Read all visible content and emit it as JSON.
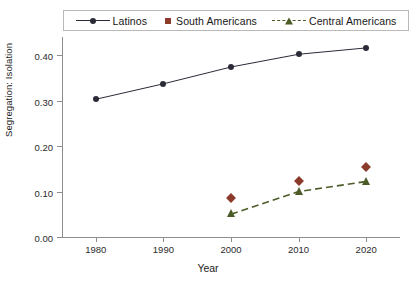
{
  "chart_data": {
    "type": "line",
    "title": "",
    "xlabel": "Year",
    "ylabel": "Segregation: Isolation",
    "x": [
      1980,
      1990,
      2000,
      2010,
      2020
    ],
    "xlim": [
      1975,
      2025
    ],
    "ylim": [
      0.0,
      0.44
    ],
    "xticks": [
      "1980",
      "1990",
      "2000",
      "2010",
      "2020"
    ],
    "yticks": [
      "0.00",
      "0.10",
      "0.20",
      "0.30",
      "0.40"
    ],
    "ytick_values": [
      0.0,
      0.1,
      0.2,
      0.3,
      0.4
    ],
    "grid": false,
    "legend_position": "top",
    "series": [
      {
        "name": "Latinos",
        "color": "#2b2b38",
        "line_style": "solid",
        "marker": "circle",
        "x": [
          1980,
          1990,
          2000,
          2010,
          2020
        ],
        "values": [
          0.303,
          0.337,
          0.374,
          0.402,
          0.416
        ]
      },
      {
        "name": "South Americans",
        "color": "#8c3a2c",
        "line_style": "none",
        "marker": "diamond",
        "x": [
          2000,
          2010,
          2020
        ],
        "values": [
          0.085,
          0.123,
          0.153
        ]
      },
      {
        "name": "Central Americans",
        "color": "#4c5c28",
        "line_style": "dashed",
        "marker": "triangle",
        "x": [
          2000,
          2010,
          2020
        ],
        "values": [
          0.05,
          0.1,
          0.122
        ]
      }
    ]
  },
  "legend": {
    "entries": [
      {
        "label": "Latinos",
        "key": "line-circle-marker"
      },
      {
        "label": "South Americans",
        "key": "diamond-marker"
      },
      {
        "label": "Central Americans",
        "key": "dashed-line-triangle-marker"
      }
    ]
  },
  "axes": {
    "x_title": "Year",
    "y_title": "Segregation: Isolation",
    "y_tick_labels": [
      "0.40",
      "0.30",
      "0.20",
      "0.10",
      "0.00"
    ],
    "x_tick_labels": [
      "1980",
      "1990",
      "2000",
      "2010",
      "2020"
    ]
  },
  "colors": {
    "latinos": "#2b2b38",
    "south_americans": "#8c3a2c",
    "central_americans": "#4c5c28",
    "axis": "#8d8d8d",
    "legend_border": "#b9b9b9",
    "background": "#ffffff"
  }
}
